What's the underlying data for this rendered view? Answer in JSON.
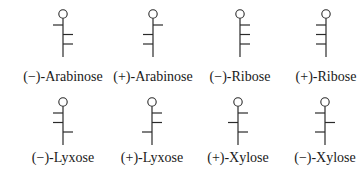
{
  "figure": {
    "structures": [
      {
        "label": "(−)-Arabinose",
        "cx": 63,
        "top": 14,
        "bonds": [
          "left",
          "right",
          "right"
        ],
        "label_y": 69
      },
      {
        "label": "(+)-Arabinose",
        "cx": 153,
        "top": 14,
        "bonds": [
          "right",
          "left",
          "left"
        ],
        "label_y": 69
      },
      {
        "label": "(−)-Ribose",
        "cx": 240,
        "top": 14,
        "bonds": [
          "right",
          "right",
          "right"
        ],
        "label_y": 69
      },
      {
        "label": "(+)-Ribose",
        "cx": 326,
        "top": 14,
        "bonds": [
          "left",
          "left",
          "left"
        ],
        "label_y": 69
      },
      {
        "label": "(−)-Lyxose",
        "cx": 63,
        "top": 102,
        "bonds": [
          "left",
          "left",
          "right"
        ],
        "label_y": 150
      },
      {
        "label": "(+)-Lyxose",
        "cx": 152,
        "top": 102,
        "bonds": [
          "right",
          "right",
          "left"
        ],
        "label_y": 150
      },
      {
        "label": "(+)-Xylose",
        "cx": 238,
        "top": 102,
        "bonds": [
          "right",
          "left",
          "right"
        ],
        "label_y": 150
      },
      {
        "label": "(−)-Xylose",
        "cx": 325,
        "top": 102,
        "bonds": [
          "left",
          "right",
          "left"
        ],
        "label_y": 150
      }
    ]
  },
  "labels": {
    "s0": "(−)-Arabinose",
    "s1": "(+)-Arabinose",
    "s2": "(−)-Ribose",
    "s3": "(+)-Ribose",
    "s4": "(−)-Lyxose",
    "s5": "(+)-Lyxose",
    "s6": "(+)-Xylose",
    "s7": "(−)-Xylose"
  },
  "colors": {
    "line": "#2a2a2a",
    "text": "#1a1a1a",
    "background": "#ffffff"
  }
}
